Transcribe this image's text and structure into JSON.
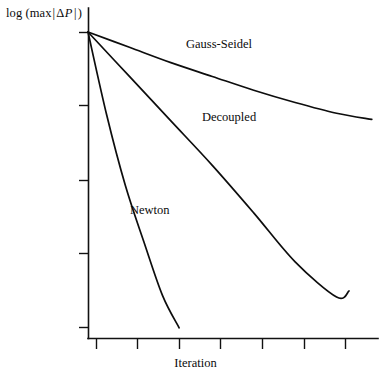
{
  "chart_data": {
    "type": "line",
    "title": "",
    "xlabel": "Iteration",
    "ylabel": "log (max |ΔP|)",
    "ylabel_parts": {
      "prefix": "log (max",
      "bar_open": "|",
      "delta": "Δ",
      "variable": "P",
      "bar_close": "|",
      "suffix": ")"
    },
    "grid": false,
    "legend": "inline-annotations",
    "axis_ticks_labeled": false,
    "xlim": [
      0,
      7
    ],
    "ylim": [
      0,
      1
    ],
    "x_tick_count": 7,
    "y_tick_count": 5,
    "x_ticks": [
      1,
      2,
      3,
      4,
      5,
      6,
      7
    ],
    "y_ticks": [
      1.0,
      0.75,
      0.5,
      0.25,
      0.0
    ],
    "series": [
      {
        "name": "Gauss-Seidel",
        "label": "Gauss-Seidel",
        "color": "#0d0d0d",
        "x": [
          0.0,
          1.0,
          2.0,
          3.0,
          4.0,
          5.0,
          6.0,
          6.85
        ],
        "y": [
          1.0,
          0.95,
          0.9,
          0.855,
          0.81,
          0.77,
          0.735,
          0.715
        ]
      },
      {
        "name": "Decoupled",
        "label": "Decoupled",
        "color": "#0d0d0d",
        "x": [
          0.0,
          1.0,
          2.0,
          3.0,
          4.0,
          5.0,
          6.0,
          6.3
        ],
        "y": [
          1.0,
          0.855,
          0.71,
          0.565,
          0.41,
          0.25,
          0.135,
          0.155
        ]
      },
      {
        "name": "Newton",
        "label": "Newton",
        "color": "#0d0d0d",
        "x": [
          0.0,
          0.45,
          0.9,
          1.35,
          1.8,
          2.2
        ],
        "y": [
          1.0,
          0.73,
          0.5,
          0.315,
          0.14,
          0.035
        ]
      }
    ]
  },
  "axes": {
    "y_axis_name": "log (max |ΔP|)",
    "x_axis_name": "Iteration"
  }
}
